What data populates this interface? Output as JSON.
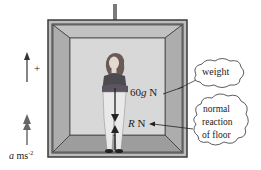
{
  "diagram": {
    "title": "",
    "labels": {
      "positive_direction": "+",
      "acceleration_var": "a",
      "acceleration_unit": " ms",
      "acceleration_exp": "-2",
      "weight_value": "60g N",
      "weight_g": "60",
      "weight_g_sym": "g",
      "weight_unit": " N",
      "reaction_var": "R",
      "reaction_unit": " N"
    },
    "callouts": {
      "weight": "weight",
      "normal_line1": "normal",
      "normal_line2": "reaction",
      "normal_line3": "of floor"
    },
    "colors": {
      "frame_dark": "#3a3a3a",
      "wall_side": "#a9a9a9",
      "wall_back": "#d6d6d6",
      "floor": "#9d9d9d",
      "ceiling": "#bdbdbd",
      "arrow": "#222222",
      "cable": "#7a7a7a"
    }
  }
}
